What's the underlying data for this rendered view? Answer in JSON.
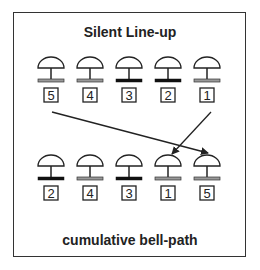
{
  "diagram": {
    "title_top": "Silent Line-up",
    "title_bottom": "cumulative bell-path",
    "colors": {
      "dark_base": "#111111",
      "light_base": "#999999",
      "line": "#222222"
    },
    "top_row": [
      {
        "label": "5",
        "base": "light"
      },
      {
        "label": "4",
        "base": "light"
      },
      {
        "label": "3",
        "base": "dark"
      },
      {
        "label": "2",
        "base": "dark"
      },
      {
        "label": "1",
        "base": "light"
      }
    ],
    "bottom_row": [
      {
        "label": "2",
        "base": "dark"
      },
      {
        "label": "4",
        "base": "light"
      },
      {
        "label": "3",
        "base": "dark"
      },
      {
        "label": "1",
        "base": "light"
      },
      {
        "label": "5",
        "base": "light"
      }
    ],
    "arrows": [
      {
        "from": "top-5",
        "to": "bottom-5"
      },
      {
        "from": "top-1",
        "to": "bottom-1"
      }
    ]
  }
}
